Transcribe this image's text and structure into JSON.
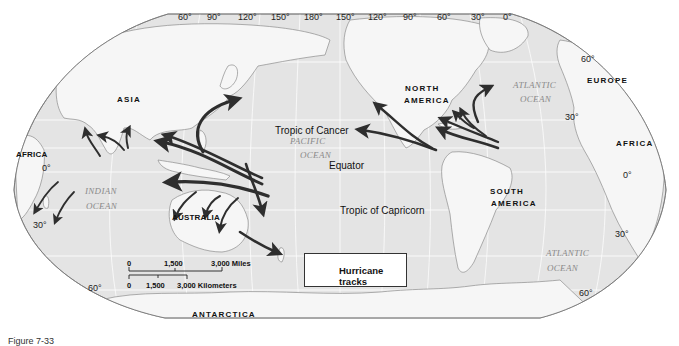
{
  "longitude_labels": [
    "60°",
    "90°",
    "120°",
    "150°",
    "180°",
    "150°",
    "120°",
    "90°",
    "60°",
    "30°",
    "0°"
  ],
  "latitude_labels": {
    "left": [
      "0°",
      "30°",
      "60°"
    ],
    "right": [
      "60°",
      "30°",
      "0°",
      "30°",
      "60°"
    ]
  },
  "continents": {
    "asia": "ASIA",
    "north_america": "NORTH",
    "north_america_2": "AMERICA",
    "south_america": "SOUTH",
    "south_america_2": "AMERICA",
    "europe": "EUROPE",
    "africa_west": "AFRICA",
    "africa_east": "AFRICA",
    "australia": "AUSTRALIA",
    "antarctica": "ANTARCTICA"
  },
  "oceans": {
    "pacific_1": "PACIFIC",
    "pacific_2": "OCEAN",
    "indian_1": "INDIAN",
    "indian_2": "OCEAN",
    "atlantic_north_1": "ATLANTIC",
    "atlantic_north_2": "OCEAN",
    "atlantic_south_1": "ATLANTIC",
    "atlantic_south_2": "OCEAN"
  },
  "reference_lines": {
    "tropic_cancer": "Tropic of Cancer",
    "equator": "Equator",
    "tropic_capricorn": "Tropic of Capricorn"
  },
  "scale": {
    "miles": [
      "0",
      "1,500",
      "3,000 Miles"
    ],
    "kilometers": [
      "0",
      "1,500",
      "3,000 Kilometers"
    ]
  },
  "legend": {
    "label": "Hurricane tracks"
  },
  "caption": "Figure 7-33",
  "colors": {
    "land": "#f2f2f2",
    "ocean": "#e3e3e3",
    "arrow": "#2e2e2e",
    "grid": "#ffffff"
  }
}
